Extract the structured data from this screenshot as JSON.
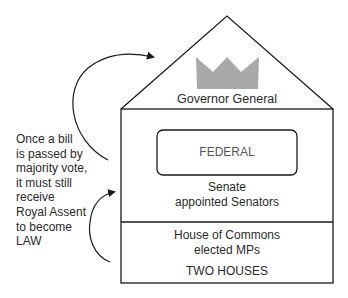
{
  "roof": {
    "crown_icon": "crown-icon",
    "crown_color": "#a9a9a9",
    "title": "Governor General"
  },
  "upper_house": {
    "badge": "FEDERAL",
    "name": "Senate",
    "members": "appointed Senators"
  },
  "lower_house": {
    "name": "House of Commons",
    "members": "elected MPs",
    "caption": "TWO HOUSES"
  },
  "side_note": "Once a bill\nis passed by\nmajority vote,\nit must still\nreceive\nRoyal Assent\nto become\nLAW",
  "colors": {
    "line": "#1a1a1a",
    "text": "#2a2a2a",
    "crown": "#a9a9a9"
  }
}
